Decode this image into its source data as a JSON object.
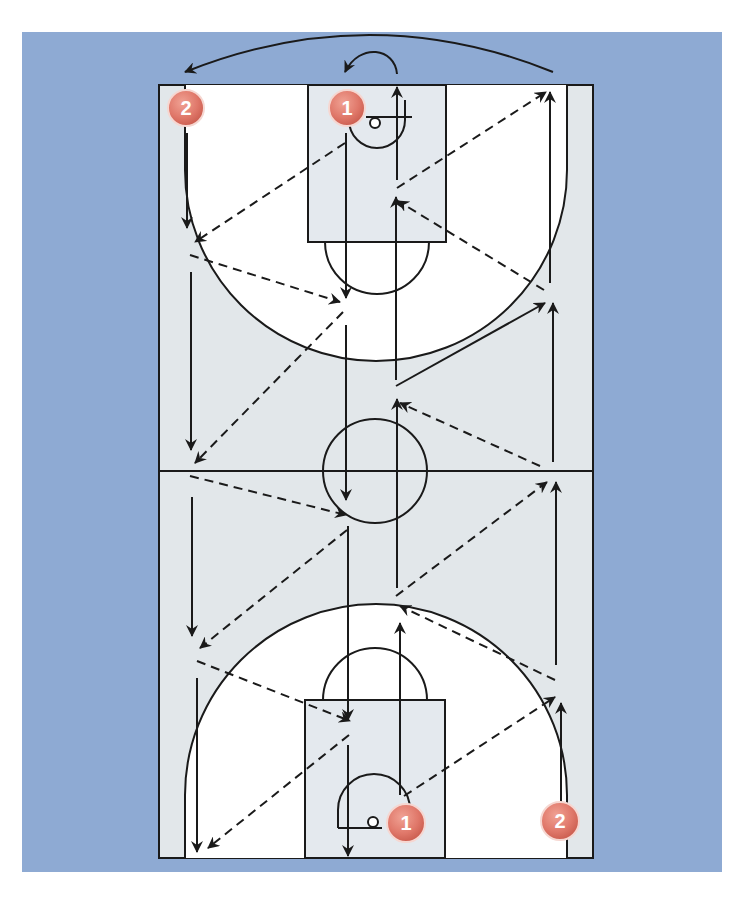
{
  "diagram": {
    "colors": {
      "background_panel": "#8eaad3",
      "court_floor": "#e2e7ea",
      "key_area": "#ffffff",
      "paint": "#e4e9ee",
      "line": "#1a1a1a",
      "badge_fill": "#e0786a",
      "badge_stroke": "#f6d7d1",
      "badge_text": "#ffffff"
    },
    "players": [
      {
        "id": "p2-top",
        "label": "2",
        "x": 186,
        "y": 110
      },
      {
        "id": "p1-top",
        "label": "1",
        "x": 347,
        "y": 110
      },
      {
        "id": "p1-bottom",
        "label": "1",
        "x": 405,
        "y": 823
      },
      {
        "id": "p2-bottom",
        "label": "2",
        "x": 560,
        "y": 823
      }
    ],
    "legend": {
      "solid_arrow": "player movement",
      "dashed_arrow": "pass",
      "curved_arrow": "rotation to opposite line"
    }
  }
}
